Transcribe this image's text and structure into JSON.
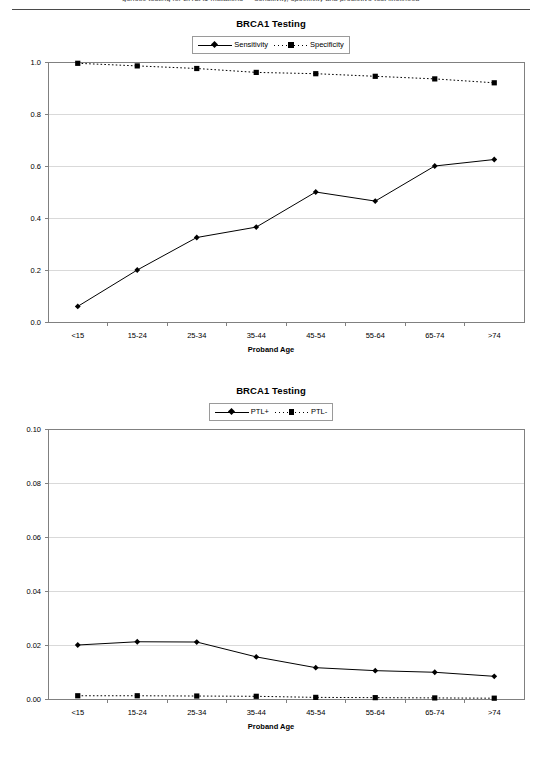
{
  "page": {
    "running_head": "genetic testing for BRCA1 mutations — sensitivity, specificity and predictive test likelihood"
  },
  "figures": [
    {
      "id": "figure-sensitivity-specificity",
      "title": "BRCA1 Testing",
      "legend": [
        {
          "label": "Sensitivity",
          "marker": "diamond",
          "line": "solid"
        },
        {
          "label": "Specificity",
          "marker": "square",
          "line": "dotted"
        }
      ],
      "xlabel": "Proband Age",
      "ylabel": "",
      "ytick_labels": [
        "0.0",
        "0.2",
        "0.4",
        "0.6",
        "0.8",
        "1.0"
      ],
      "xtick_labels": [
        "<15",
        "15-24",
        "25-34",
        "35-44",
        "45-54",
        "55-64",
        "65-74",
        ">74"
      ]
    },
    {
      "id": "figure-ptl",
      "title": "BRCA1 Testing",
      "legend": [
        {
          "label": "PTL+",
          "marker": "diamond",
          "line": "solid"
        },
        {
          "label": "PTL-",
          "marker": "square",
          "line": "dotted"
        }
      ],
      "xlabel": "Proband Age",
      "ylabel": "",
      "ytick_labels": [
        "0.00",
        "0.02",
        "0.04",
        "0.06",
        "0.08",
        "0.10"
      ],
      "xtick_labels": [
        "<15",
        "15-24",
        "25-34",
        "35-44",
        "45-54",
        "55-64",
        "65-74",
        ">74"
      ]
    }
  ],
  "chart_data": [
    {
      "type": "line",
      "title": "BRCA1 Testing",
      "xlabel": "Proband Age",
      "ylabel": "",
      "categories": [
        "<15",
        "15-24",
        "25-34",
        "35-44",
        "45-54",
        "55-64",
        "65-74",
        ">74"
      ],
      "ylim": [
        0.0,
        1.0
      ],
      "yticks": [
        0.0,
        0.2,
        0.4,
        0.6,
        0.8,
        1.0
      ],
      "grid": true,
      "legend_position": "top-center",
      "series": [
        {
          "name": "Sensitivity",
          "marker": "diamond",
          "line": "solid",
          "color": "#000000",
          "values": [
            0.06,
            0.2,
            0.325,
            0.365,
            0.5,
            0.465,
            0.6,
            0.625
          ]
        },
        {
          "name": "Specificity",
          "marker": "square",
          "line": "dotted",
          "color": "#000000",
          "values": [
            0.995,
            0.985,
            0.975,
            0.96,
            0.955,
            0.945,
            0.935,
            0.92
          ]
        }
      ]
    },
    {
      "type": "line",
      "title": "BRCA1 Testing",
      "xlabel": "Proband Age",
      "ylabel": "",
      "categories": [
        "<15",
        "15-24",
        "25-34",
        "35-44",
        "45-54",
        "55-64",
        "65-74",
        ">74"
      ],
      "ylim": [
        0.0,
        0.1
      ],
      "yticks": [
        0.0,
        0.02,
        0.04,
        0.06,
        0.08,
        0.1
      ],
      "grid": true,
      "legend_position": "top-center",
      "series": [
        {
          "name": "PTL+",
          "marker": "diamond",
          "line": "solid",
          "color": "#000000",
          "values": [
            0.02,
            0.0212,
            0.0211,
            0.0156,
            0.0116,
            0.0105,
            0.0099,
            0.0084
          ]
        },
        {
          "name": "PTL-",
          "marker": "square",
          "line": "dotted",
          "color": "#000000",
          "values": [
            0.0012,
            0.0012,
            0.0011,
            0.001,
            0.0006,
            0.0005,
            0.0004,
            0.0003
          ]
        }
      ]
    }
  ],
  "colors": {
    "ink": "#000000",
    "grid": "#d9d9d9",
    "frame": "#808080",
    "rule": "#4a4a4a"
  }
}
